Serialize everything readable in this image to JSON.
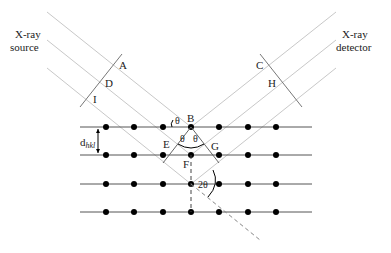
{
  "diagram": {
    "source_label_line1": "X-ray",
    "source_label_line2": "source",
    "detector_label_line1": "X-ray",
    "detector_label_line2": "detector",
    "points": {
      "A": "A",
      "D": "D",
      "I": "I",
      "C": "C",
      "H": "H",
      "B": "B",
      "E": "E",
      "F": "F",
      "G": "G"
    },
    "angles": {
      "theta": "θ",
      "theta_left": "θ",
      "theta_right": "θ",
      "two_theta": "2θ"
    },
    "spacing_label_main": "d",
    "spacing_label_sub": "hkl",
    "colors": {
      "ray": "#c8c8c8",
      "lattice_line": "#555555",
      "atom": "#000000",
      "construction": "#444444",
      "text": "#222222"
    }
  }
}
